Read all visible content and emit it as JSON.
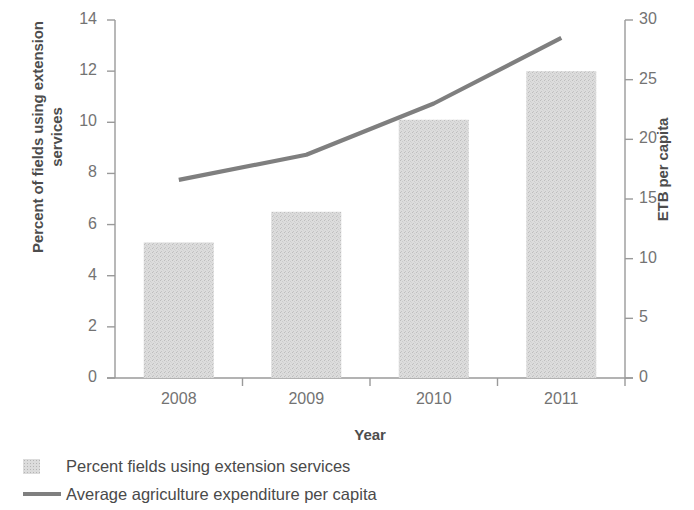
{
  "chart_data": {
    "type": "bar",
    "title": "",
    "categories": [
      "2008",
      "2009",
      "2010",
      "2011"
    ],
    "xlabel": "Year",
    "ylabel": "Percent of fields using extension services",
    "y2label": "ETB per capita",
    "ylim": [
      0,
      14
    ],
    "y2lim": [
      0,
      30
    ],
    "yticks": [
      "0",
      "2",
      "4",
      "6",
      "8",
      "10",
      "12",
      "14"
    ],
    "ytick_values": [
      0,
      2,
      4,
      6,
      8,
      10,
      12,
      14
    ],
    "y2ticks": [
      "0",
      "5",
      "10",
      "15",
      "20",
      "25",
      "30"
    ],
    "y2tick_values": [
      0,
      5,
      10,
      15,
      20,
      25,
      30
    ],
    "grid": false,
    "legend_position": "bottom-left",
    "series": [
      {
        "name": "Percent fields using extension services",
        "type": "bar",
        "axis": "left",
        "color": "#dcdcdc",
        "values": [
          5.3,
          6.5,
          10.1,
          12.0
        ]
      },
      {
        "name": "Average agriculture expenditure per capita",
        "type": "line",
        "axis": "right",
        "color": "#7f7f7f",
        "values": [
          16.6,
          18.7,
          23.0,
          28.5
        ]
      }
    ]
  },
  "legend": {
    "items": [
      {
        "label": "Percent fields using extension services",
        "marker": "bar-swatch-icon"
      },
      {
        "label": "Average agriculture expenditure per capita",
        "marker": "line-swatch-icon"
      }
    ]
  },
  "axes": {
    "x_title": "Year",
    "y_left_title": "Percent of fields using extension services",
    "y_right_title": "ETB per capita"
  }
}
